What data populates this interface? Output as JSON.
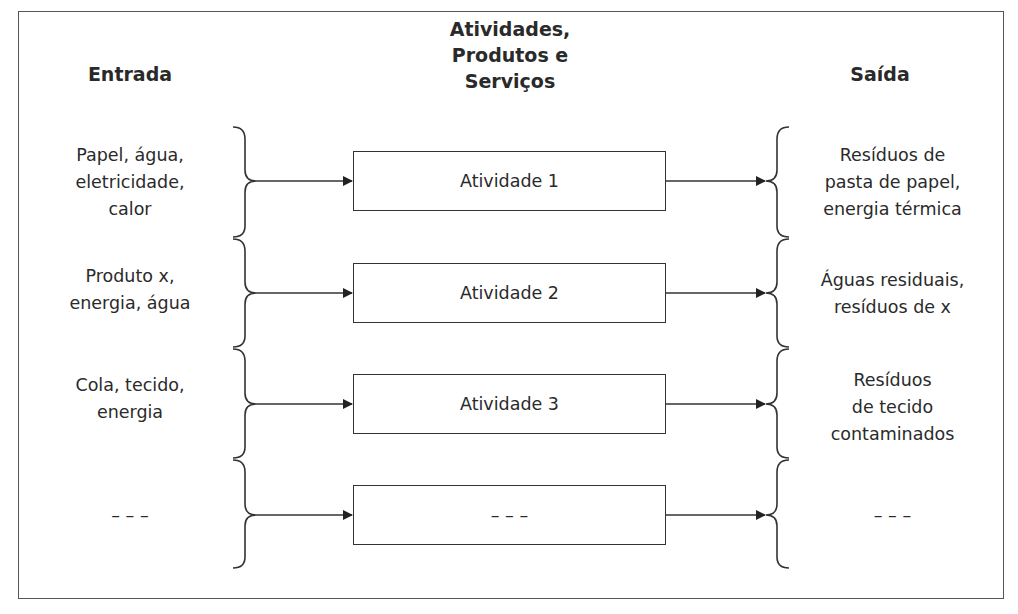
{
  "headers": {
    "input": "Entrada",
    "activities": [
      "Atividades,",
      "Produtos e",
      "Serviços"
    ],
    "output": "Saída"
  },
  "rows": [
    {
      "input": [
        "Papel, água,",
        "eletricidade,",
        "calor"
      ],
      "activity": "Atividade 1",
      "output": [
        "Resíduos de",
        "pasta de papel,",
        "energia térmica"
      ]
    },
    {
      "input": [
        "Produto x,",
        "energia, água"
      ],
      "activity": "Atividade 2",
      "output": [
        "Águas residuais,",
        "resíduos de x"
      ]
    },
    {
      "input": [
        "Cola, tecido,",
        "energia"
      ],
      "activity": "Atividade 3",
      "output": [
        "Resíduos",
        "de tecido",
        "contaminados"
      ]
    },
    {
      "input": [
        "– – –"
      ],
      "activity": "– – –",
      "output": [
        "– – –"
      ]
    }
  ],
  "colors": {
    "line": "#333333",
    "text": "#2a2a2a",
    "frame": "#555555",
    "background": "#ffffff"
  }
}
